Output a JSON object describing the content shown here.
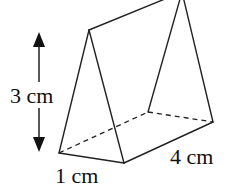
{
  "figure": {
    "type": "triangular-prism",
    "labels": {
      "height": "3 cm",
      "base": "1 cm",
      "length": "4 cm"
    },
    "colors": {
      "line": "#222222",
      "background": "#ffffff"
    }
  }
}
